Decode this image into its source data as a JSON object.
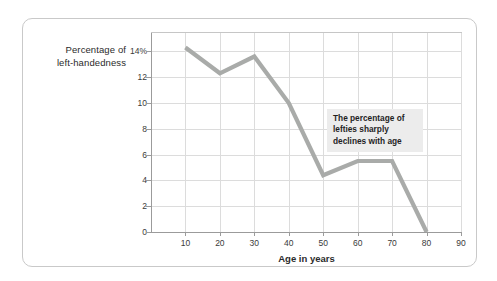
{
  "chart_data": {
    "type": "line",
    "title": "",
    "subtitle": "",
    "xlabel": "Age in years",
    "ylabel": "Percentage of left-handedness",
    "ylabel_line1": "Percentage of",
    "ylabel_line2": "left-handedness",
    "x": [
      10,
      20,
      30,
      40,
      50,
      60,
      70,
      80
    ],
    "values": [
      14.3,
      12.3,
      13.6,
      10.0,
      4.4,
      5.5,
      5.5,
      0.0
    ],
    "xlim": [
      0,
      90
    ],
    "ylim": [
      0,
      15.5
    ],
    "xticks": [
      10,
      20,
      30,
      40,
      50,
      60,
      70,
      80,
      90
    ],
    "xticklabels": [
      "10",
      "20",
      "30",
      "40",
      "50",
      "60",
      "70",
      "80",
      "90"
    ],
    "yticks": [
      0,
      2,
      4,
      6,
      8,
      10,
      12,
      14
    ],
    "yticklabels": [
      "0",
      "2",
      "4",
      "6",
      "8",
      "10",
      "12",
      "14%"
    ],
    "grid": true,
    "legend": false,
    "series": [
      {
        "name": "Percentage of left-handedness",
        "color": "#a9aba9",
        "values": [
          14.3,
          12.3,
          13.6,
          10.0,
          4.4,
          5.5,
          5.5,
          0.0
        ]
      }
    ],
    "annotations": [
      {
        "text": "The percentage of lefties sharply declines with age",
        "line1": "The percentage of",
        "line2": "lefties sharply",
        "line3": "declines with age",
        "background": "#ececec",
        "x": 57,
        "y": 9
      }
    ]
  },
  "colors": {
    "line": "#a9aba9",
    "grid": "#dcdcdc",
    "axis": "#9b9b9b",
    "card_border": "#c9c9c9",
    "annotation_bg": "#ececec",
    "text": "#2b2b2b",
    "page_bg": "#ffffff"
  }
}
